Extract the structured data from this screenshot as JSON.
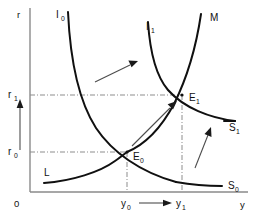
{
  "figure": {
    "background_color": "#ffffff",
    "curve_color": "#101010",
    "axis_color": "#8a8a8a",
    "guide_color": "#8d8d8d",
    "arrow_color": "#4d4d4d"
  },
  "axes": {
    "origin_label": "0",
    "y_axis_label": "r",
    "x_axis_label": "y",
    "y_ticks": [
      {
        "id": "r0",
        "base": "r",
        "sub": "0",
        "value_y": 152
      },
      {
        "id": "r1",
        "base": "r",
        "sub": "1",
        "value_y": 95
      }
    ],
    "x_ticks": [
      {
        "id": "y0",
        "base": "y",
        "sub": "0",
        "value_x": 127
      },
      {
        "id": "y1",
        "base": "y",
        "sub": "1",
        "value_x": 182
      }
    ]
  },
  "curves": [
    {
      "id": "I0",
      "base": "I",
      "sub": "0",
      "label_x": 56,
      "label_y": 16,
      "kind": "downward-sloping-demand"
    },
    {
      "id": "I1",
      "base": "I",
      "sub": "1",
      "label_x": 146,
      "label_y": 28,
      "kind": "downward-sloping-demand-shifted"
    },
    {
      "id": "M",
      "base": "M",
      "sub": "",
      "label_x": 210,
      "label_y": 18,
      "kind": "upward-sloping-supply-money"
    },
    {
      "id": "L",
      "base": "L",
      "sub": "",
      "label_x": 44,
      "label_y": 172,
      "kind": "upward-sloping-supply"
    },
    {
      "id": "S0",
      "base": "S",
      "sub": "0",
      "label_x": 228,
      "label_y": 186,
      "kind": "supply-end-label"
    },
    {
      "id": "S1",
      "base": "S",
      "sub": "1",
      "label_x": 229,
      "label_y": 128,
      "kind": "supply-end-label"
    }
  ],
  "equilibria": [
    {
      "id": "E0",
      "base": "E",
      "sub": "0",
      "x": 127,
      "y": 152,
      "label_x": 133,
      "label_y": 158
    },
    {
      "id": "E1",
      "base": "E",
      "sub": "1",
      "x": 182,
      "y": 95,
      "label_x": 189,
      "label_y": 99
    }
  ],
  "annotations": {
    "r_shift_arrow": "upward vertical arrow on r axis from r0 to r1",
    "is_shift_arrow": "diagonal arrow up-right indicating I0 shifting to I1",
    "equilibrium_move_arrow": "diagonal arrow from E0 up-right to E1",
    "s_shift_arrow": "diagonal arrow up-left indicating S0 shifting to S1",
    "y_shift_arrow": "horizontal arrow from y0 to y1 along the x axis"
  }
}
